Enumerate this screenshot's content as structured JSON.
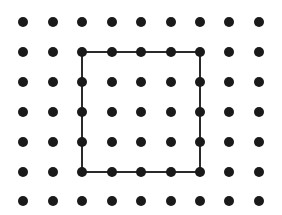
{
  "diagram": {
    "type": "dot-grid",
    "grid": {
      "columns": 9,
      "rows": 7,
      "x_positions": [
        23,
        53,
        82,
        112,
        141,
        171,
        200,
        229,
        259
      ],
      "y_positions": [
        22,
        52,
        82,
        112,
        142,
        172,
        201
      ],
      "dot_radius": 5,
      "dot_color": "#1a1a1a"
    },
    "square": {
      "from_col": 2,
      "from_row": 1,
      "to_col": 6,
      "to_row": 5,
      "side_units": 4,
      "stroke_color": "#2a2a2a",
      "stroke_width": 2
    }
  }
}
